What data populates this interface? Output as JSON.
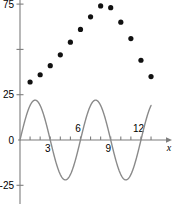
{
  "chart_data": {
    "type": "scatter",
    "title": "",
    "xlabel": "x",
    "ylabel": "",
    "xlim": [
      -0.4,
      14.2
    ],
    "ylim": [
      -31,
      82
    ],
    "grid": false,
    "legend": false,
    "axis_style": "two-axis-cross-origin",
    "x_ticks_major": [
      3,
      6,
      9,
      12
    ],
    "x_tick_labels": [
      "3",
      "6",
      "9",
      "12"
    ],
    "x_tick_label_positions": [
      "below",
      "above",
      "below",
      "above"
    ],
    "x_ticks_minor": [
      1,
      2,
      3,
      4,
      5,
      6,
      7,
      8,
      9,
      10,
      11,
      12,
      13
    ],
    "y_ticks": [
      -25,
      0,
      25,
      50,
      75
    ],
    "y_tick_labels": [
      "-25",
      "0",
      "25",
      "",
      "75"
    ],
    "arrow_on_x_axis": true,
    "series": [
      {
        "name": "data points",
        "type": "scatter",
        "marker": "circle",
        "color": "#111111",
        "marker_size": 4,
        "x": [
          1,
          2,
          3,
          4,
          5,
          6,
          7,
          8,
          9,
          10,
          11,
          12,
          13
        ],
        "y": [
          32,
          36,
          41,
          47,
          54,
          61,
          68,
          74,
          73,
          65,
          56,
          44,
          35
        ]
      },
      {
        "name": "sine curve",
        "type": "line",
        "color": "#8a8a8a",
        "line_width": 1.4,
        "equation": "y = 22 sin(2*pi*x/6)",
        "amplitude": 22,
        "period": 6,
        "phase": 0,
        "x_range": [
          0,
          13
        ],
        "zeros": [
          0,
          3,
          6,
          9,
          12
        ],
        "maxima_x": [
          1.5,
          7.5
        ],
        "maxima_y": 22,
        "minima_x": [
          4.5,
          10.5
        ],
        "minima_y": -22
      }
    ]
  }
}
